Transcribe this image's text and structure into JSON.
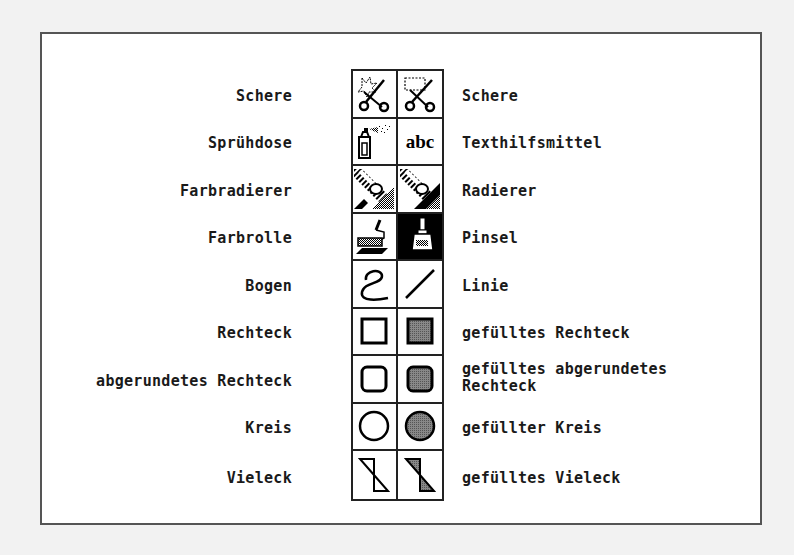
{
  "tools": [
    {
      "left": "Schere",
      "right": "Schere",
      "left_icon": "lasso-scissors-icon",
      "right_icon": "rect-select-scissors-icon"
    },
    {
      "left": "Sprühdose",
      "right": "Texthilfsmittel",
      "left_icon": "spray-can-icon",
      "right_icon": "text-abc-icon"
    },
    {
      "left": "Farbradierer",
      "right": "Radierer",
      "left_icon": "color-eraser-icon",
      "right_icon": "eraser-icon"
    },
    {
      "left": "Farbrolle",
      "right": "Pinsel",
      "left_icon": "paint-roller-icon",
      "right_icon": "paintbrush-icon"
    },
    {
      "left": "Bogen",
      "right": "Linie",
      "left_icon": "curve-icon",
      "right_icon": "line-icon"
    },
    {
      "left": "Rechteck",
      "right": "gefülltes Rechteck",
      "left_icon": "rectangle-icon",
      "right_icon": "filled-rectangle-icon"
    },
    {
      "left": "abgerundetes Rechteck",
      "right": "gefülltes abgerundetes Rechteck",
      "left_icon": "rounded-rectangle-icon",
      "right_icon": "filled-rounded-rectangle-icon"
    },
    {
      "left": "Kreis",
      "right": "gefüllter Kreis",
      "left_icon": "circle-icon",
      "right_icon": "filled-circle-icon"
    },
    {
      "left": "Vieleck",
      "right": "gefülltes Vieleck",
      "left_icon": "polygon-icon",
      "right_icon": "filled-polygon-icon"
    }
  ],
  "icon_text": "abc"
}
